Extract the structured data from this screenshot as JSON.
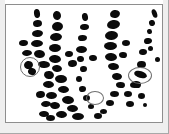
{
  "figure": {
    "kind": "micrograph-plate",
    "caption": "",
    "width_px": 169,
    "height_px": 134,
    "background_color": "#ffffff",
    "plate_border_color": "#8e8e8e",
    "outer_rule_color": "#a8a8a8",
    "spot_color": "#0b0b0b",
    "marker_color": "#6f6f6f",
    "lane_count": 5,
    "spot_count": 72,
    "marker_count": 3
  },
  "lanes": [
    {
      "id": "lane-1",
      "label": "",
      "spot_count": 15
    },
    {
      "id": "lane-2",
      "label": "",
      "spot_count": 15
    },
    {
      "id": "lane-3",
      "label": "",
      "spot_count": 14
    },
    {
      "id": "lane-4",
      "label": "",
      "spot_count": 16
    },
    {
      "id": "lane-5",
      "label": "",
      "spot_count": 12
    }
  ],
  "spots": [
    {
      "lane": 1,
      "x": 28,
      "y": 4,
      "w": 6,
      "h": 9,
      "r": -8
    },
    {
      "lane": 1,
      "x": 27,
      "y": 15,
      "w": 9,
      "h": 7,
      "r": -6
    },
    {
      "lane": 1,
      "x": 26,
      "y": 25,
      "w": 11,
      "h": 7,
      "r": -4
    },
    {
      "lane": 1,
      "x": 25,
      "y": 35,
      "w": 12,
      "h": 7,
      "r": -2
    },
    {
      "lane": 1,
      "x": 28,
      "y": 45,
      "w": 11,
      "h": 8,
      "r": 6
    },
    {
      "lane": 1,
      "x": 32,
      "y": 56,
      "w": 12,
      "h": 7,
      "r": 4
    },
    {
      "lane": 1,
      "x": 38,
      "y": 66,
      "w": 10,
      "h": 8,
      "r": 10
    },
    {
      "lane": 1,
      "x": 37,
      "y": 76,
      "w": 11,
      "h": 7,
      "r": 2
    },
    {
      "lane": 1,
      "x": 40,
      "y": 87,
      "w": 11,
      "h": 7,
      "r": 0
    },
    {
      "lane": 1,
      "x": 44,
      "y": 97,
      "w": 10,
      "h": 7,
      "r": 4
    },
    {
      "lane": 1,
      "x": 50,
      "y": 106,
      "w": 11,
      "h": 7,
      "r": 2
    },
    {
      "lane": 1,
      "x": 18,
      "y": 56,
      "w": 9,
      "h": 8,
      "r": -14
    },
    {
      "lane": 1,
      "x": 22,
      "y": 63,
      "w": 8,
      "h": 7,
      "r": 22
    },
    {
      "lane": 1,
      "x": 16,
      "y": 45,
      "w": 10,
      "h": 6,
      "r": -4
    },
    {
      "lane": 1,
      "x": 13,
      "y": 35,
      "w": 9,
      "h": 6,
      "r": -4
    },
    {
      "lane": 2,
      "x": 47,
      "y": 6,
      "w": 8,
      "h": 9,
      "r": -12
    },
    {
      "lane": 2,
      "x": 46,
      "y": 17,
      "w": 11,
      "h": 9,
      "r": -6
    },
    {
      "lane": 2,
      "x": 44,
      "y": 28,
      "w": 12,
      "h": 8,
      "r": -4
    },
    {
      "lane": 2,
      "x": 43,
      "y": 39,
      "w": 12,
      "h": 8,
      "r": 0
    },
    {
      "lane": 2,
      "x": 43,
      "y": 50,
      "w": 12,
      "h": 8,
      "r": 4
    },
    {
      "lane": 2,
      "x": 46,
      "y": 60,
      "w": 10,
      "h": 7,
      "r": 6
    },
    {
      "lane": 2,
      "x": 49,
      "y": 70,
      "w": 12,
      "h": 8,
      "r": 2
    },
    {
      "lane": 2,
      "x": 52,
      "y": 81,
      "w": 11,
      "h": 7,
      "r": 2
    },
    {
      "lane": 2,
      "x": 56,
      "y": 91,
      "w": 12,
      "h": 8,
      "r": 4
    },
    {
      "lane": 2,
      "x": 61,
      "y": 100,
      "w": 11,
      "h": 7,
      "r": 2
    },
    {
      "lane": 2,
      "x": 66,
      "y": 108,
      "w": 12,
      "h": 7,
      "r": 0
    },
    {
      "lane": 2,
      "x": 35,
      "y": 96,
      "w": 10,
      "h": 6,
      "r": -4
    },
    {
      "lane": 2,
      "x": 30,
      "y": 86,
      "w": 9,
      "h": 7,
      "r": -6
    },
    {
      "lane": 2,
      "x": 33,
      "y": 106,
      "w": 10,
      "h": 6,
      "r": 2
    },
    {
      "lane": 2,
      "x": 40,
      "y": 110,
      "w": 9,
      "h": 6,
      "r": 0
    },
    {
      "lane": 3,
      "x": 76,
      "y": 8,
      "w": 6,
      "h": 8,
      "r": -10
    },
    {
      "lane": 3,
      "x": 74,
      "y": 19,
      "w": 9,
      "h": 6,
      "r": -4
    },
    {
      "lane": 3,
      "x": 72,
      "y": 30,
      "w": 9,
      "h": 6,
      "r": -2
    },
    {
      "lane": 3,
      "x": 70,
      "y": 41,
      "w": 11,
      "h": 7,
      "r": 0
    },
    {
      "lane": 3,
      "x": 71,
      "y": 51,
      "w": 7,
      "h": 6,
      "r": 4
    },
    {
      "lane": 3,
      "x": 74,
      "y": 61,
      "w": 7,
      "h": 6,
      "r": 2
    },
    {
      "lane": 3,
      "x": 70,
      "y": 71,
      "w": 6,
      "h": 6,
      "r": 0
    },
    {
      "lane": 3,
      "x": 73,
      "y": 81,
      "w": 7,
      "h": 6,
      "r": 2
    },
    {
      "lane": 3,
      "x": 77,
      "y": 90,
      "w": 7,
      "h": 6,
      "r": 0
    },
    {
      "lane": 3,
      "x": 82,
      "y": 99,
      "w": 6,
      "h": 5,
      "r": 0
    },
    {
      "lane": 3,
      "x": 88,
      "y": 108,
      "w": 8,
      "h": 6,
      "r": 0
    },
    {
      "lane": 3,
      "x": 62,
      "y": 55,
      "w": 9,
      "h": 7,
      "r": -6
    },
    {
      "lane": 3,
      "x": 59,
      "y": 46,
      "w": 8,
      "h": 6,
      "r": -4
    },
    {
      "lane": 3,
      "x": 83,
      "y": 50,
      "w": 8,
      "h": 6,
      "r": 4
    },
    {
      "lane": 4,
      "x": 104,
      "y": 5,
      "w": 10,
      "h": 8,
      "r": -14
    },
    {
      "lane": 4,
      "x": 101,
      "y": 15,
      "w": 13,
      "h": 9,
      "r": -8
    },
    {
      "lane": 4,
      "x": 99,
      "y": 26,
      "w": 13,
      "h": 9,
      "r": -4
    },
    {
      "lane": 4,
      "x": 98,
      "y": 37,
      "w": 13,
      "h": 8,
      "r": 0
    },
    {
      "lane": 4,
      "x": 99,
      "y": 48,
      "w": 12,
      "h": 8,
      "r": 4
    },
    {
      "lane": 4,
      "x": 102,
      "y": 58,
      "w": 11,
      "h": 7,
      "r": 4
    },
    {
      "lane": 4,
      "x": 106,
      "y": 68,
      "w": 10,
      "h": 7,
      "r": 4
    },
    {
      "lane": 4,
      "x": 110,
      "y": 77,
      "w": 9,
      "h": 6,
      "r": 2
    },
    {
      "lane": 4,
      "x": 104,
      "y": 86,
      "w": 9,
      "h": 6,
      "r": 0
    },
    {
      "lane": 4,
      "x": 100,
      "y": 95,
      "w": 8,
      "h": 6,
      "r": 0
    },
    {
      "lane": 4,
      "x": 94,
      "y": 104,
      "w": 7,
      "h": 5,
      "r": 0
    },
    {
      "lane": 4,
      "x": 118,
      "y": 86,
      "w": 8,
      "h": 6,
      "r": 0
    },
    {
      "lane": 4,
      "x": 124,
      "y": 77,
      "w": 9,
      "h": 6,
      "r": 0
    },
    {
      "lane": 4,
      "x": 120,
      "y": 96,
      "w": 8,
      "h": 6,
      "r": 0
    },
    {
      "lane": 4,
      "x": 113,
      "y": 47,
      "w": 8,
      "h": 6,
      "r": 2
    },
    {
      "lane": 4,
      "x": 116,
      "y": 35,
      "w": 8,
      "h": 6,
      "r": 0
    },
    {
      "lane": 5,
      "x": 146,
      "y": 4,
      "w": 5,
      "h": 9,
      "r": -20
    },
    {
      "lane": 5,
      "x": 143,
      "y": 15,
      "w": 6,
      "h": 6,
      "r": -14
    },
    {
      "lane": 5,
      "x": 141,
      "y": 24,
      "w": 5,
      "h": 5,
      "r": -8
    },
    {
      "lane": 5,
      "x": 138,
      "y": 33,
      "w": 8,
      "h": 6,
      "r": -6
    },
    {
      "lane": 5,
      "x": 142,
      "y": 41,
      "w": 5,
      "h": 5,
      "r": 0
    },
    {
      "lane": 5,
      "x": 133,
      "y": 44,
      "w": 8,
      "h": 6,
      "r": -4
    },
    {
      "lane": 5,
      "x": 131,
      "y": 56,
      "w": 9,
      "h": 7,
      "r": -4
    },
    {
      "lane": 5,
      "x": 128,
      "y": 66,
      "w": 13,
      "h": 7,
      "r": 16
    },
    {
      "lane": 5,
      "x": 126,
      "y": 76,
      "w": 9,
      "h": 7,
      "r": 8
    },
    {
      "lane": 5,
      "x": 132,
      "y": 88,
      "w": 7,
      "h": 6,
      "r": 0
    },
    {
      "lane": 5,
      "x": 137,
      "y": 98,
      "w": 4,
      "h": 4,
      "r": 0
    },
    {
      "lane": 5,
      "x": 149,
      "y": 52,
      "w": 5,
      "h": 5,
      "r": 0
    }
  ],
  "markers": [
    {
      "id": "marker-1",
      "label": "",
      "x": 14,
      "y": 52,
      "w": 20,
      "h": 20,
      "target": "lane-1 doublet"
    },
    {
      "id": "marker-2",
      "label": "",
      "x": 80,
      "y": 86,
      "w": 18,
      "h": 14,
      "target": "lane-3 doublet"
    },
    {
      "id": "marker-3",
      "label": "",
      "x": 122,
      "y": 62,
      "w": 24,
      "h": 17,
      "target": "lane-5 elongated band"
    }
  ],
  "grain": [
    {
      "x": 0,
      "y": 0,
      "w": 5,
      "h": 134
    },
    {
      "x": 163,
      "y": 0,
      "w": 6,
      "h": 134
    },
    {
      "x": 0,
      "y": 123,
      "w": 169,
      "h": 11
    }
  ]
}
